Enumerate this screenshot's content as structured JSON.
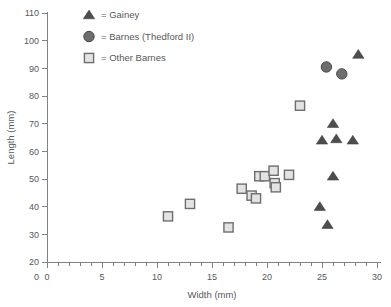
{
  "chart_data": {
    "type": "scatter",
    "title": "",
    "xlabel": "Width (mm)",
    "ylabel": "Length (mm)",
    "xlim": [
      0,
      30
    ],
    "ylim": [
      20,
      110
    ],
    "xticks": [
      0,
      5,
      10,
      15,
      20,
      25,
      30
    ],
    "yticks": [
      20,
      30,
      40,
      50,
      60,
      70,
      80,
      90,
      100,
      110
    ],
    "x_minor_step": 1,
    "grid": false,
    "legend_position": "top-left-inside",
    "series": [
      {
        "name": "Gainey",
        "marker": "triangle",
        "color": "#4d4d4f",
        "points": [
          [
            24.8,
            40.0
          ],
          [
            25.5,
            33.5
          ],
          [
            25.0,
            64.0
          ],
          [
            26.0,
            70.0
          ],
          [
            26.3,
            64.5
          ],
          [
            26.0,
            51.0
          ],
          [
            27.8,
            64.0
          ],
          [
            28.3,
            95.0
          ]
        ]
      },
      {
        "name": "Barnes (Thedford II)",
        "marker": "circle",
        "color": "#6d6e70",
        "points": [
          [
            25.4,
            90.5
          ],
          [
            26.8,
            88.0
          ]
        ]
      },
      {
        "name": "Other Barnes",
        "marker": "square",
        "color": "#e3e3e3",
        "points": [
          [
            11.0,
            36.5
          ],
          [
            13.0,
            41.0
          ],
          [
            16.5,
            32.5
          ],
          [
            17.7,
            46.5
          ],
          [
            18.6,
            44.0
          ],
          [
            19.0,
            43.0
          ],
          [
            19.3,
            51.0
          ],
          [
            19.8,
            51.0
          ],
          [
            20.6,
            53.0
          ],
          [
            20.7,
            48.5
          ],
          [
            20.8,
            47.0
          ],
          [
            22.0,
            51.5
          ],
          [
            23.0,
            76.5
          ]
        ]
      }
    ],
    "legend": [
      {
        "label": "= Gainey",
        "marker": "triangle"
      },
      {
        "label": "= Barnes (Thedford II)",
        "marker": "circle"
      },
      {
        "label": "= Other Barnes",
        "marker": "square"
      }
    ]
  }
}
